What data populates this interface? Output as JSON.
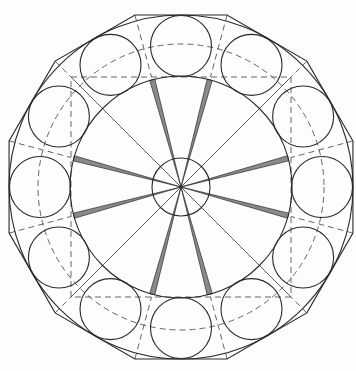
{
  "diagram": {
    "title": "",
    "canvas": {
      "width": 356,
      "height": 371,
      "background": "#fdfdfd"
    },
    "center": {
      "x": 181,
      "y": 187
    },
    "outer_dodecagon": {
      "vertex_radius": 178,
      "vertex_start_angle_deg": 15,
      "vertex_count": 12
    },
    "outer_circle": {
      "radius": 172
    },
    "ring_circles": {
      "count": 12,
      "orbit_radius": 141,
      "radius": 30.5,
      "start_angle_deg": 0
    },
    "dashed_circle": {
      "radius": 143
    },
    "inner_circle": {
      "radius": 111
    },
    "dashed_square": {
      "half_size": 110
    },
    "hub_circle": {
      "radius": 29
    },
    "diagonal_spokes": {
      "angles_deg": [
        45,
        135,
        225,
        315
      ]
    },
    "shaded_wedges": {
      "angles_deg": [
        15,
        75,
        105,
        165,
        195,
        255,
        285,
        345
      ],
      "half_width_at_rim": 2.6,
      "fill": "#8a8a8a"
    },
    "colors": {
      "line": "#2a2a2a",
      "dash": "#555555",
      "wedge_fill": "#8a8a8a"
    }
  }
}
